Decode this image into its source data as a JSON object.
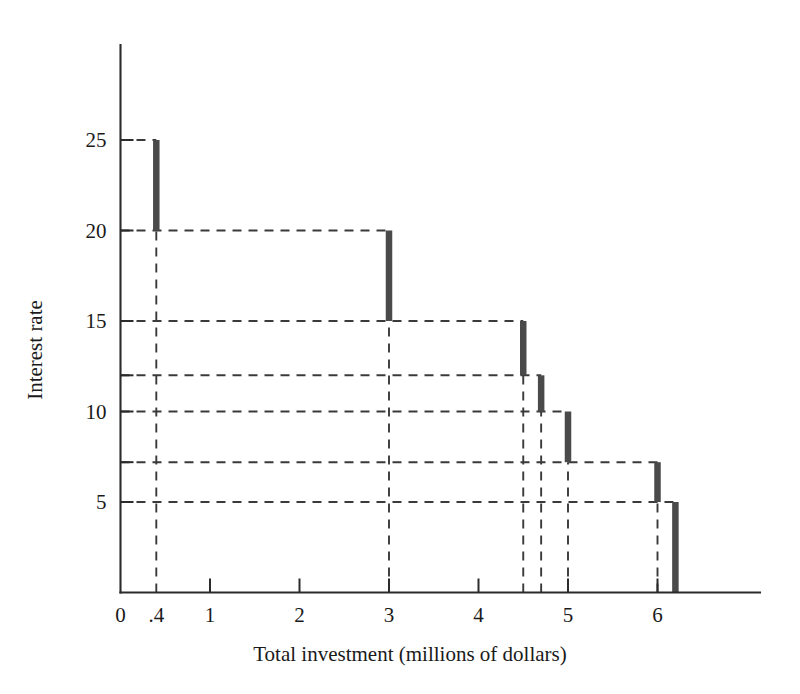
{
  "chart_data": {
    "type": "line",
    "title": "",
    "xlabel": "Total investment (millions of dollars)",
    "ylabel": "Interest rate",
    "xlim": [
      0,
      7.1
    ],
    "ylim": [
      0,
      28.5
    ],
    "grid": "dashed-guides",
    "legend": "none",
    "x_ticks": [
      {
        "value": 0,
        "label": "0"
      },
      {
        "value": 0.4,
        "label": ".4"
      },
      {
        "value": 1,
        "label": "1"
      },
      {
        "value": 2,
        "label": "2"
      },
      {
        "value": 3,
        "label": "3"
      },
      {
        "value": 4,
        "label": "4"
      },
      {
        "value": 5,
        "label": "5"
      },
      {
        "value": 6,
        "label": "6"
      }
    ],
    "y_ticks": [
      {
        "value": 5,
        "label": "5"
      },
      {
        "value": 7.2,
        "label": ""
      },
      {
        "value": 10,
        "label": "10"
      },
      {
        "value": 12,
        "label": ""
      },
      {
        "value": 15,
        "label": "15"
      },
      {
        "value": 20,
        "label": "20"
      },
      {
        "value": 25,
        "label": "25"
      }
    ],
    "steps": [
      {
        "x": 0.4,
        "y_top": 25,
        "y_bottom": 20
      },
      {
        "x": 3.0,
        "y_top": 20,
        "y_bottom": 15
      },
      {
        "x": 4.5,
        "y_top": 15,
        "y_bottom": 12
      },
      {
        "x": 4.7,
        "y_top": 12,
        "y_bottom": 10
      },
      {
        "x": 5.0,
        "y_top": 10,
        "y_bottom": 7.2
      },
      {
        "x": 6.0,
        "y_top": 7.2,
        "y_bottom": 5
      },
      {
        "x": 6.2,
        "y_top": 5,
        "y_bottom": 0
      }
    ],
    "horizontal_guides": [
      {
        "y": 25,
        "x_from": 0,
        "x_to": 0.4
      },
      {
        "y": 20,
        "x_from": 0,
        "x_to": 3.0
      },
      {
        "y": 15,
        "x_from": 0,
        "x_to": 4.5
      },
      {
        "y": 12,
        "x_from": 0,
        "x_to": 4.7
      },
      {
        "y": 10,
        "x_from": 0,
        "x_to": 5.0
      },
      {
        "y": 7.2,
        "x_from": 0,
        "x_to": 6.0
      },
      {
        "y": 5,
        "x_from": 0,
        "x_to": 6.2
      }
    ],
    "vertical_guides": [
      {
        "x": 0.4,
        "y_from": 0,
        "y_to": 20
      },
      {
        "x": 3.0,
        "y_from": 0,
        "y_to": 15
      },
      {
        "x": 4.5,
        "y_from": 0,
        "y_to": 12
      },
      {
        "x": 4.7,
        "y_from": 0,
        "y_to": 10
      },
      {
        "x": 5.0,
        "y_from": 0,
        "y_to": 7.2
      },
      {
        "x": 6.0,
        "y_from": 0,
        "y_to": 5
      }
    ],
    "colors": {
      "background": "#ffffff",
      "axis": "#2b2b2b",
      "bar": "#4a4a4a",
      "guide": "#3a3a3a",
      "text": "#1a1a1a"
    }
  }
}
